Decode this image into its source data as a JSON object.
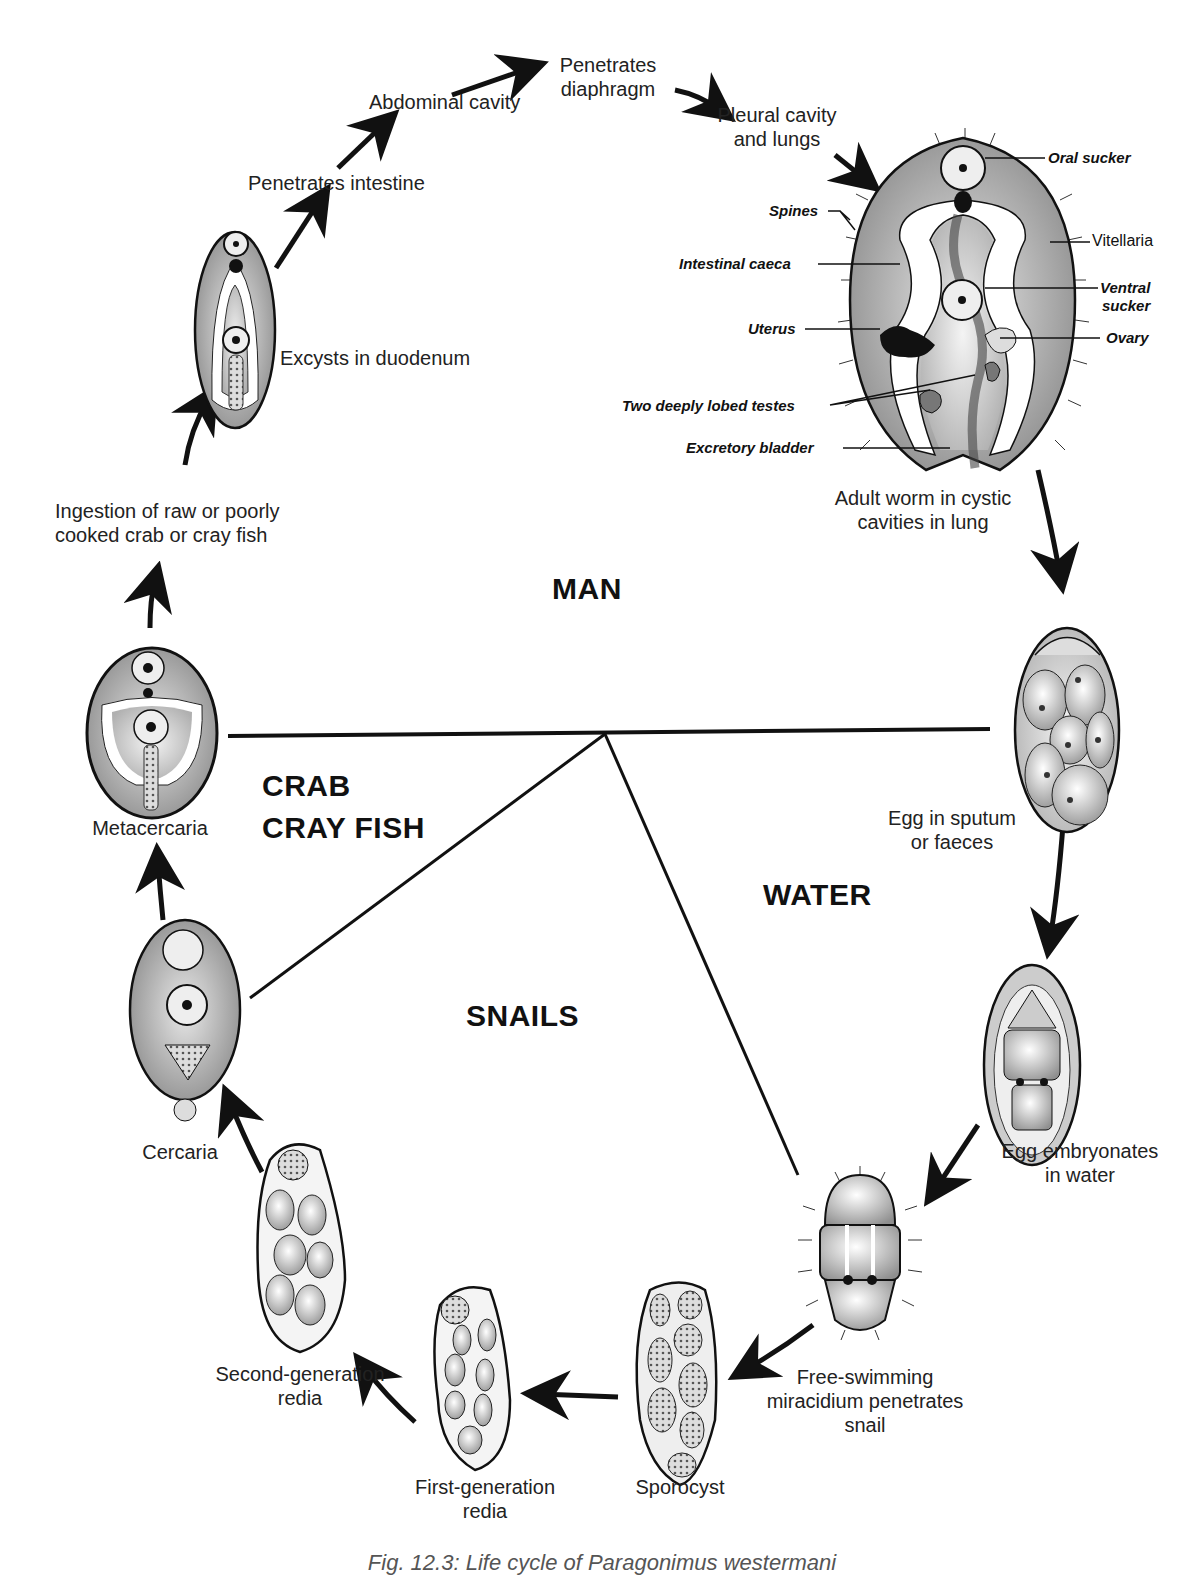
{
  "figure": {
    "title": "Life cycle of Paragonimus westermani",
    "caption": "Fig. 12.3: Life cycle of Paragonimus westermani"
  },
  "zones": {
    "man": "MAN",
    "crab": "CRAB",
    "crayfish": "CRAY FISH",
    "water": "WATER",
    "snails": "SNAILS"
  },
  "stages": {
    "excysts": "Excysts in duodenum",
    "penetrates_intestine": "Penetrates intestine",
    "abdominal_cavity": "Abdominal cavity",
    "penetrates_diaphragm_1": "Penetrates",
    "penetrates_diaphragm_2": "diaphragm",
    "pleural_1": "Pleural cavity",
    "pleural_2": "and lungs",
    "adult_1": "Adult worm in cystic",
    "adult_2": "cavities in lung",
    "egg_1": "Egg in sputum",
    "egg_2": "or faeces",
    "embryo_1": "Egg embryonates",
    "embryo_2": "in water",
    "miracidium_1": "Free-swimming",
    "miracidium_2": "miracidium penetrates",
    "miracidium_3": "snail",
    "sporocyst": "Sporocyst",
    "first_redia_1": "First-generation",
    "first_redia_2": "redia",
    "second_redia_1": "Second-generation",
    "second_redia_2": "redia",
    "cercaria": "Cercaria",
    "metacercaria": "Metacercaria",
    "ingestion_1": "Ingestion of raw or poorly",
    "ingestion_2": "cooked crab or cray fish"
  },
  "anatomy": {
    "oral_sucker": "Oral sucker",
    "spines": "Spines",
    "vitellaria": "Vitellaria",
    "intestinal_caeca": "Intestinal caeca",
    "ventral_sucker_1": "Ventral",
    "ventral_sucker_2": "sucker",
    "uterus": "Uterus",
    "ovary": "Ovary",
    "testes": "Two deeply lobed testes",
    "excretory_bladder": "Excretory bladder"
  }
}
